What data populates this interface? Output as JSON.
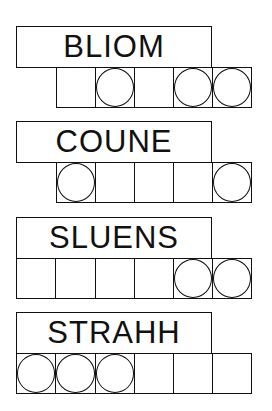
{
  "puzzles": [
    {
      "scrambled": "BLIOM",
      "tile_count": 5,
      "tiles_offset": "right",
      "circled": [
        false,
        true,
        false,
        true,
        true
      ]
    },
    {
      "scrambled": "COUNE",
      "tile_count": 5,
      "tiles_offset": "right",
      "circled": [
        true,
        false,
        false,
        false,
        true
      ]
    },
    {
      "scrambled": "SLUENS",
      "tile_count": 6,
      "tiles_offset": "left",
      "circled": [
        false,
        false,
        false,
        false,
        true,
        true
      ]
    },
    {
      "scrambled": "STRAHH",
      "tile_count": 6,
      "tiles_offset": "left",
      "circled": [
        true,
        true,
        true,
        false,
        false,
        false
      ]
    }
  ]
}
